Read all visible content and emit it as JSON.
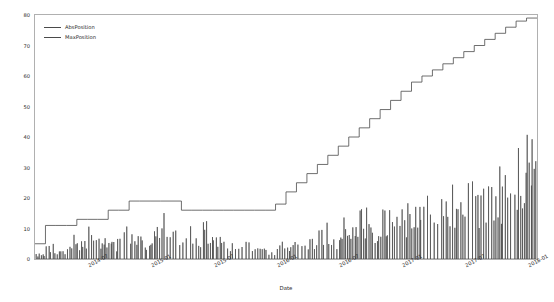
{
  "chart_data": {
    "type": "line",
    "title": "",
    "xlabel": "Date",
    "ylabel": "",
    "grid": false,
    "legend_position": "top-left",
    "ylim": [
      0,
      80
    ],
    "yticks": [
      0,
      10,
      20,
      30,
      40,
      50,
      60,
      70,
      80
    ],
    "xticks": [
      "2014-07",
      "2015-01",
      "2015-07",
      "2016-01",
      "2016-07",
      "2017-01",
      "2017-07",
      "2018-01"
    ],
    "xlim": [
      "2014-02",
      "2018-02"
    ],
    "series": [
      {
        "name": "AbsPosition",
        "color": "#4a4a4a",
        "x": [
          "2014-02",
          "2014-03",
          "2014-04",
          "2014-05",
          "2014-06",
          "2014-07",
          "2014-08",
          "2014-09",
          "2014-10",
          "2014-11",
          "2014-12",
          "2015-01",
          "2015-02",
          "2015-03",
          "2015-04",
          "2015-05",
          "2015-06",
          "2015-07",
          "2015-08",
          "2015-09",
          "2015-10",
          "2015-11",
          "2015-12",
          "2016-01",
          "2016-02",
          "2016-03",
          "2016-04",
          "2016-05",
          "2016-06",
          "2016-07",
          "2016-08",
          "2016-09",
          "2016-10",
          "2016-11",
          "2016-12",
          "2017-01",
          "2017-02",
          "2017-03",
          "2017-04",
          "2017-05",
          "2017-06",
          "2017-07",
          "2017-08",
          "2017-09",
          "2017-10",
          "2017-11",
          "2017-12",
          "2018-01"
        ],
        "values": [
          2,
          5,
          3,
          8,
          6,
          11,
          9,
          7,
          12,
          10,
          8,
          13,
          19,
          12,
          15,
          11,
          14,
          9,
          6,
          4,
          7,
          5,
          3,
          8,
          6,
          10,
          7,
          12,
          9,
          14,
          11,
          17,
          13,
          19,
          16,
          20,
          18,
          24,
          21,
          27,
          23,
          30,
          26,
          34,
          31,
          38,
          42,
          47
        ]
      },
      {
        "name": "MaxPosition",
        "color": "#4a4a4a",
        "x": [
          "2014-02",
          "2014-03",
          "2014-04",
          "2014-05",
          "2014-06",
          "2014-07",
          "2014-08",
          "2014-09",
          "2014-10",
          "2014-11",
          "2014-12",
          "2015-01",
          "2015-02",
          "2015-03",
          "2015-04",
          "2015-05",
          "2015-06",
          "2015-07",
          "2015-08",
          "2015-09",
          "2015-10",
          "2015-11",
          "2015-12",
          "2016-01",
          "2016-02",
          "2016-03",
          "2016-04",
          "2016-05",
          "2016-06",
          "2016-07",
          "2016-08",
          "2016-09",
          "2016-10",
          "2016-11",
          "2016-12",
          "2017-01",
          "2017-02",
          "2017-03",
          "2017-04",
          "2017-05",
          "2017-06",
          "2017-07",
          "2017-08",
          "2017-09",
          "2017-10",
          "2017-11",
          "2017-12",
          "2018-01"
        ],
        "values": [
          5,
          11,
          11,
          11,
          13,
          13,
          13,
          16,
          16,
          19,
          19,
          19,
          19,
          19,
          16,
          16,
          16,
          16,
          16,
          16,
          16,
          16,
          16,
          18,
          22,
          25,
          28,
          31,
          34,
          37,
          40,
          43,
          46,
          49,
          52,
          55,
          58,
          60,
          62,
          64,
          66,
          68,
          70,
          72,
          74,
          76,
          78,
          79
        ]
      }
    ]
  },
  "legend": {
    "items": [
      {
        "label": "AbsPosition"
      },
      {
        "label": "MaxPosition"
      }
    ]
  },
  "axis": {
    "xlabel": "Date"
  }
}
